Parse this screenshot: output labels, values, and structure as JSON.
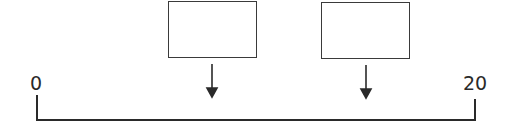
{
  "diagram": {
    "type": "number-line-with-boxes",
    "number_line": {
      "start_label": "0",
      "end_label": "20",
      "start_value": 0,
      "end_value": 20
    },
    "boxes": [
      {
        "id": "box-1",
        "content": ""
      },
      {
        "id": "box-2",
        "content": ""
      }
    ],
    "arrows": [
      {
        "from": "box-1",
        "direction": "down",
        "icon": "arrow-down-icon"
      },
      {
        "from": "box-2",
        "direction": "down",
        "icon": "arrow-down-icon"
      }
    ],
    "colors": {
      "stroke": "#2a2a2a",
      "background": "#ffffff"
    }
  }
}
